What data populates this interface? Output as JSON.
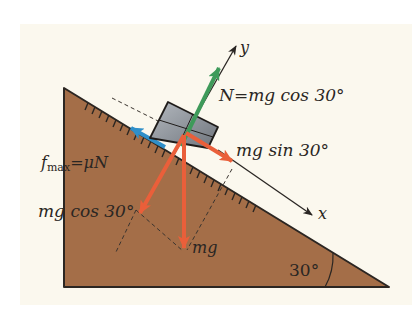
{
  "diagram": {
    "colors": {
      "background": "#ffffff",
      "panel": "#fbf8ee",
      "wedge": "#a46e48",
      "wedge_edge": "#2b2622",
      "block": "#8d949c",
      "normal_arrow": "#3e9a5a",
      "weight_arrows": "#ea5f3a",
      "friction_arrow": "#2f8fc9",
      "axis": "#2a2623"
    },
    "incline_angle": "30°",
    "axes": {
      "x_label": "x",
      "y_label": "y"
    },
    "labels": {
      "normal": {
        "lhs": "N",
        "eq": "=",
        "rhs": "mg cos 30°"
      },
      "friction": {
        "f": "f",
        "sub": "max",
        "eq": "=",
        "rhs": "μN"
      },
      "parallel": "mg sin 30°",
      "perpendicular": "mg cos 30°",
      "weight": "mg",
      "angle": "30°"
    }
  }
}
